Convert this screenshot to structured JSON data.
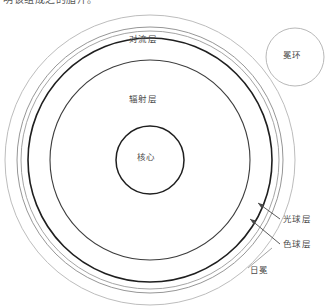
{
  "caption": {
    "clipped_top_text": "明该组成之的脂汗。"
  },
  "diagram": {
    "title_label": "太阳结构",
    "labels": {
      "convection_zone": "对流层",
      "radiative_zone": "辐射层",
      "core": "核心",
      "coronal_loop": "冕环",
      "photosphere": "光球层",
      "chromosphere": "色球层",
      "corona": "日冕"
    },
    "colors": {
      "stroke_dark": "#1a1a1a",
      "stroke_mid": "#555555",
      "stroke_light": "#b0b0b0",
      "background": "#ffffff",
      "text": "#4a4a4a"
    },
    "geometry": {
      "center_x": 150,
      "center_y": 160,
      "corona_radius": 145,
      "chromosphere_radius": 133,
      "photosphere_radius": 129,
      "convection_radius": 122,
      "radiative_radius": 100,
      "core_radius": 34,
      "coronal_loop_center_x": 295,
      "coronal_loop_center_y": 57,
      "coronal_loop_radius": 29
    }
  }
}
